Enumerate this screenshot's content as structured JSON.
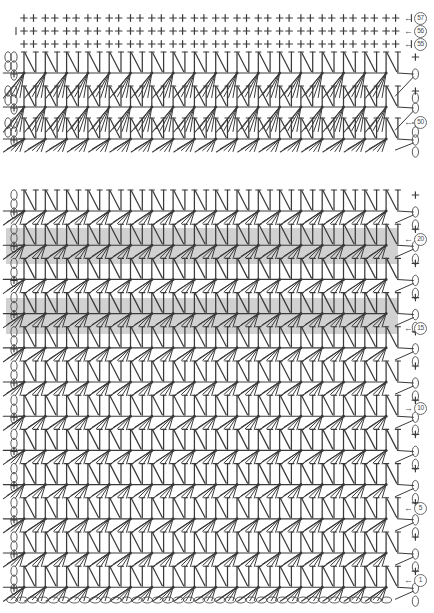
{
  "chart": {
    "type": "crochet-pattern-diagram",
    "width": 434,
    "height": 613,
    "background_color": "#ffffff",
    "ink_color": "#3a3a3a",
    "highlight_color": "#c9c9c9",
    "sections": [
      {
        "name": "upper-section",
        "top": 8,
        "bottom": 152,
        "single_crochet_rows": 3,
        "shell_rows": 3,
        "repeats_per_row": 18
      },
      {
        "name": "lower-section",
        "top": 186,
        "bottom": 600,
        "shell_rows": 12,
        "repeats_per_row": 18,
        "foundation_chain": true
      }
    ],
    "highlight_bands": [
      {
        "label": "20",
        "y": 228,
        "height": 36
      },
      {
        "label": "15",
        "y": 298,
        "height": 36
      }
    ],
    "row_labels": [
      {
        "number": "57",
        "arrow": "←",
        "direction": "left",
        "y": 18
      },
      {
        "number": "56",
        "arrow": "←",
        "direction": "left",
        "y": 31
      },
      {
        "number": "55",
        "arrow": "←",
        "direction": "left",
        "y": 44
      },
      {
        "number": "50",
        "arrow": "←",
        "direction": "left",
        "y": 122
      },
      {
        "number": "20",
        "arrow": "←",
        "direction": "left",
        "y": 239
      },
      {
        "number": "15",
        "arrow": "←",
        "direction": "left",
        "y": 328
      },
      {
        "number": "10",
        "arrow": "→",
        "direction": "right",
        "y": 408
      },
      {
        "number": "5",
        "arrow": "←",
        "direction": "left",
        "y": 508
      },
      {
        "number": "1",
        "arrow": "←",
        "direction": "left",
        "y": 580
      }
    ],
    "symbols": {
      "single_crochet": "+",
      "chain": "oval",
      "v_stitch": "V",
      "shell": "fan",
      "slip_stitch": "dot"
    },
    "legend": {
      "plus_meaning": "single crochet",
      "oval_meaning": "chain stitch",
      "v_meaning": "double crochet V-stitch",
      "fan_meaning": "shell / fan cluster"
    }
  },
  "chart_data": {
    "type": "table",
    "xlabel": "",
    "ylabel": "Row number",
    "categories": [
      "57",
      "56",
      "55",
      "50",
      "20",
      "15",
      "10",
      "5",
      "1"
    ],
    "values": [
      57,
      56,
      55,
      50,
      20,
      15,
      10,
      5,
      1
    ],
    "series": [
      {
        "name": "row-direction",
        "values": [
          "left",
          "left",
          "left",
          "left",
          "left",
          "left",
          "right",
          "left",
          "left"
        ]
      }
    ],
    "annotations": [
      "Rows 55-57 worked in single crochet (+)",
      "Shell / V-stitch pattern repeated 18 times per row",
      "Rows 15 and 20 highlighted with gray band",
      "Row 1 begins on foundation chain"
    ],
    "legend_position": "right",
    "grid": false
  }
}
